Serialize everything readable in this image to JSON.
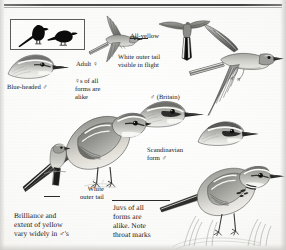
{
  "plate": {
    "subject": "yellow-wagtail-field-guide-plate",
    "page_width": 286,
    "page_height": 250,
    "background_color": "#fbfbfa",
    "ink_color": "#17171a",
    "rule_color": "#3c3c3a"
  },
  "captions": {
    "all_yellow": "All-yellow",
    "white_outer_tail_flight": "White outer tail\nvisible in flight",
    "adult_female": "Adult ♀",
    "females_alike": "♀s of all\nforms are\nalike",
    "blue_headed_male": "Blue-headed ♂",
    "male_britain": "♂ (Britain)",
    "scandinavian_form_male": "Scandinavian\nform ♂",
    "white_outer_tail": "White\nouter tail",
    "brilliance_note": "Brilliance and\nextent of yellow\nvary widely in ♂'s",
    "juvenile_note": "Juvs of all\nforms are\nalike. Note\nthroat marks"
  },
  "figures": {
    "silhouette_box": "two-black-wagtail-silhouettes",
    "flying_adult_female": "adult-female-in-flight",
    "tail_fan_all_yellow": "spread-tail-showing-white-outer-feathers",
    "large_flying_male": "large-male-in-flight-underside",
    "head_blue_headed_male": "head-profile-blue-headed-male",
    "head_male_britain": "head-profile-male-britain",
    "head_scandinavian_male": "head-profile-scandinavian-male",
    "perched_male_main": "main-standing-male-yellow-wagtail",
    "small_perched_rear": "small-perched-bird-rear-view",
    "juvenile_standing": "juvenile-standing-with-throat-marks"
  }
}
